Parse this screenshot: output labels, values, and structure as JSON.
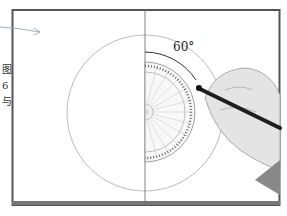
{
  "illustration": {
    "angle_label": "60°",
    "side_text": [
      "图",
      "6",
      "与"
    ],
    "colors": {
      "frame": "#555555",
      "circle": "#aaaaaa",
      "line": "#666666",
      "arrow": "#9ab0c0",
      "protractor_tick": "#666666",
      "skin": "#e4e4e4",
      "pen": "#1e1e1e"
    }
  }
}
